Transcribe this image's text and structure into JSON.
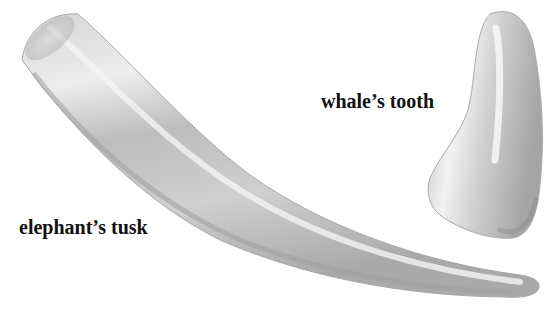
{
  "figure": {
    "labels": {
      "whale_tooth": "whale’s tooth",
      "elephant_tusk": "elephant’s tusk"
    },
    "objects": [
      {
        "name": "elephant-tusk",
        "color": "#c4c4c4",
        "highlight": "#ececec",
        "shadow": "#9a9a9a"
      },
      {
        "name": "whale-tooth",
        "color": "#c8c8c8",
        "highlight": "#f0f0f0",
        "shadow": "#9c9c9c"
      }
    ],
    "background": "#ffffff"
  }
}
